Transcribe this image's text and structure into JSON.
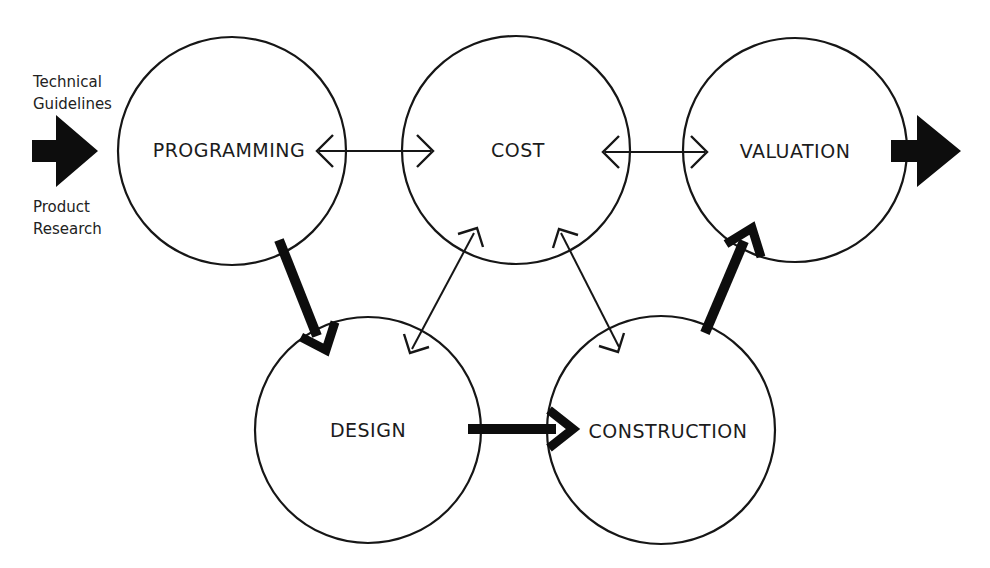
{
  "colors": {
    "ink": "#141414",
    "background": "#ffffff"
  },
  "nodes": {
    "programming": {
      "label": "PROGRAMMING"
    },
    "cost": {
      "label": "COST"
    },
    "valuation": {
      "label": "VALUATION"
    },
    "design": {
      "label": "DESIGN"
    },
    "construction": {
      "label": "CONSTRUCTION"
    }
  },
  "input_annotations": {
    "above_arrow": {
      "line1": "Technical",
      "line2": "Guidelines"
    },
    "below_arrow": {
      "line1": "Product",
      "line2": "Research"
    }
  },
  "edges": [
    {
      "from": "external-input",
      "to": "programming",
      "style": "thick-block",
      "bidirectional": false
    },
    {
      "from": "programming",
      "to": "cost",
      "style": "thin-open",
      "bidirectional": true
    },
    {
      "from": "cost",
      "to": "valuation",
      "style": "thin-open",
      "bidirectional": true
    },
    {
      "from": "design",
      "to": "cost",
      "style": "thin-open",
      "bidirectional": true
    },
    {
      "from": "cost",
      "to": "construction",
      "style": "thin-open",
      "bidirectional": true
    },
    {
      "from": "programming",
      "to": "design",
      "style": "thick",
      "bidirectional": false
    },
    {
      "from": "design",
      "to": "construction",
      "style": "thick",
      "bidirectional": false
    },
    {
      "from": "construction",
      "to": "valuation",
      "style": "thick",
      "bidirectional": false
    },
    {
      "from": "valuation",
      "to": "external-output",
      "style": "thick-block",
      "bidirectional": false
    }
  ]
}
